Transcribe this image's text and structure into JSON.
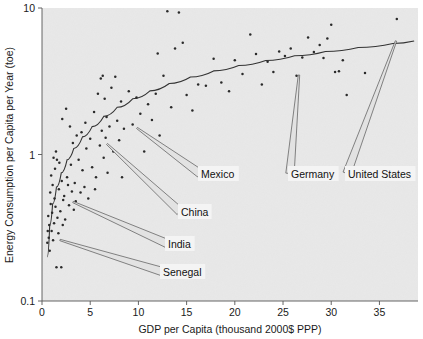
{
  "chart_data": {
    "type": "scatter",
    "title": "",
    "xlabel": "GDP per Capita (thousand 2000$ PPP)",
    "ylabel": "Energy Consumption per Capita per Year (toe)",
    "xlim": [
      0,
      39
    ],
    "ylim": [
      0.1,
      10
    ],
    "xscale": "linear",
    "yscale": "log",
    "grid": false,
    "legend": "none",
    "xticks": [
      0,
      5,
      10,
      15,
      20,
      25,
      30,
      35
    ],
    "xtick_labels": [
      "0",
      "5",
      "10",
      "15",
      "20",
      "25",
      "30",
      "35"
    ],
    "yticks": [
      0.1,
      1,
      10
    ],
    "ytick_labels": [
      "0.1",
      "1",
      "10"
    ],
    "series": [
      {
        "name": "countries",
        "marker": "dot",
        "points": [
          [
            0.6,
            0.3
          ],
          [
            0.7,
            0.27
          ],
          [
            0.75,
            0.33
          ],
          [
            0.8,
            0.22
          ],
          [
            0.85,
            0.55
          ],
          [
            0.9,
            0.46
          ],
          [
            0.95,
            0.72
          ],
          [
            1.0,
            0.3
          ],
          [
            1.05,
            0.4
          ],
          [
            1.1,
            0.62
          ],
          [
            1.15,
            0.26
          ],
          [
            1.2,
            0.95
          ],
          [
            1.25,
            0.34
          ],
          [
            1.3,
            0.5
          ],
          [
            1.35,
            0.8
          ],
          [
            1.4,
            0.44
          ],
          [
            1.45,
            1.05
          ],
          [
            1.5,
            0.17
          ],
          [
            1.6,
            0.37
          ],
          [
            1.7,
            0.29
          ],
          [
            1.75,
            0.58
          ],
          [
            1.8,
            0.88
          ],
          [
            1.9,
            0.41
          ],
          [
            2.0,
            0.17
          ],
          [
            2.05,
            0.66
          ],
          [
            2.1,
            1.75
          ],
          [
            2.2,
            0.49
          ],
          [
            2.3,
            0.52
          ],
          [
            2.4,
            0.36
          ],
          [
            2.5,
            2.05
          ],
          [
            2.6,
            0.7
          ],
          [
            2.7,
            0.62
          ],
          [
            2.8,
            0.45
          ],
          [
            2.9,
            1.55
          ],
          [
            3.0,
            0.85
          ],
          [
            3.1,
            0.56
          ],
          [
            3.2,
            1.2
          ],
          [
            3.4,
            0.64
          ],
          [
            3.5,
            0.48
          ],
          [
            3.6,
            1.35
          ],
          [
            3.8,
            0.92
          ],
          [
            4.0,
            0.55
          ],
          [
            4.1,
            1.42
          ],
          [
            4.2,
            0.78
          ],
          [
            4.4,
            0.6
          ],
          [
            4.6,
            1.1
          ],
          [
            4.8,
            0.5
          ],
          [
            5.0,
            1.28
          ],
          [
            5.2,
            0.82
          ],
          [
            5.4,
            1.95
          ],
          [
            5.6,
            0.7
          ],
          [
            5.8,
            2.6
          ],
          [
            6.0,
            1.15
          ],
          [
            6.1,
            3.3
          ],
          [
            6.2,
            1.45
          ],
          [
            6.3,
            3.45
          ],
          [
            6.4,
            0.95
          ],
          [
            6.5,
            2.4
          ],
          [
            6.6,
            1.3
          ],
          [
            6.8,
            0.75
          ],
          [
            7.0,
            1.55
          ],
          [
            7.2,
            2.85
          ],
          [
            7.4,
            1.05
          ],
          [
            7.6,
            3.4
          ],
          [
            7.8,
            1.7
          ],
          [
            8.0,
            1.25
          ],
          [
            8.2,
            2.3
          ],
          [
            8.5,
            1.5
          ],
          [
            8.8,
            0.88
          ],
          [
            9.0,
            2.7
          ],
          [
            9.4,
            1.6
          ],
          [
            9.8,
            2.45
          ],
          [
            10.2,
            1.9
          ],
          [
            10.6,
            1.05
          ],
          [
            11.0,
            2.2
          ],
          [
            11.4,
            1.72
          ],
          [
            11.8,
            2.6
          ],
          [
            12.2,
            1.35
          ],
          [
            12.6,
            3.45
          ],
          [
            13.0,
            9.5
          ],
          [
            13.4,
            2.1
          ],
          [
            13.8,
            5.3
          ],
          [
            14.2,
            9.3
          ],
          [
            14.6,
            5.8
          ],
          [
            15.0,
            2.55
          ],
          [
            15.6,
            2.0
          ],
          [
            16.2,
            3.0
          ],
          [
            17.0,
            2.95
          ],
          [
            17.8,
            4.5
          ],
          [
            18.6,
            3.1
          ],
          [
            19.4,
            2.7
          ],
          [
            20.0,
            4.4
          ],
          [
            20.8,
            3.55
          ],
          [
            21.6,
            6.6
          ],
          [
            22.2,
            4.85
          ],
          [
            22.8,
            3.0
          ],
          [
            23.4,
            4.3
          ],
          [
            24.0,
            3.65
          ],
          [
            24.6,
            5.05
          ],
          [
            25.2,
            4.7
          ],
          [
            25.8,
            5.3
          ],
          [
            26.4,
            3.45
          ],
          [
            27.0,
            4.6
          ],
          [
            27.6,
            6.3
          ],
          [
            28.2,
            5.0
          ],
          [
            28.8,
            5.6
          ],
          [
            29.2,
            4.55
          ],
          [
            29.6,
            6.2
          ],
          [
            30.0,
            7.7
          ],
          [
            30.4,
            3.65
          ],
          [
            30.8,
            3.7
          ],
          [
            31.2,
            4.4
          ],
          [
            31.6,
            2.55
          ],
          [
            33.5,
            3.6
          ],
          [
            36.8,
            8.4
          ],
          [
            0.55,
            0.25
          ],
          [
            0.65,
            0.38
          ],
          [
            1.55,
            0.92
          ],
          [
            2.15,
            0.33
          ],
          [
            3.3,
            0.42
          ],
          [
            4.5,
            1.65
          ],
          [
            5.5,
            0.58
          ],
          [
            6.7,
            1.8
          ],
          [
            8.3,
            0.7
          ],
          [
            12.0,
            4.9
          ]
        ]
      }
    ],
    "trend_curve": {
      "description": "smooth rising log-like fit through the cloud",
      "points": [
        [
          0.55,
          0.2
        ],
        [
          0.8,
          0.33
        ],
        [
          1.1,
          0.46
        ],
        [
          1.5,
          0.6
        ],
        [
          2.0,
          0.75
        ],
        [
          2.6,
          0.92
        ],
        [
          3.3,
          1.1
        ],
        [
          4.2,
          1.32
        ],
        [
          5.2,
          1.55
        ],
        [
          6.4,
          1.82
        ],
        [
          7.8,
          2.1
        ],
        [
          9.4,
          2.4
        ],
        [
          11.2,
          2.72
        ],
        [
          13.2,
          3.05
        ],
        [
          15.4,
          3.38
        ],
        [
          17.8,
          3.72
        ],
        [
          20.4,
          4.05
        ],
        [
          23.2,
          4.38
        ],
        [
          26.2,
          4.72
        ],
        [
          29.4,
          5.05
        ],
        [
          32.8,
          5.38
        ],
        [
          36.4,
          5.72
        ],
        [
          38.6,
          5.95
        ]
      ]
    },
    "annotations": [
      {
        "label": "Mexico",
        "point": [
          9.2,
          1.88
        ],
        "box_x": 198,
        "box_y": 166,
        "tip_x": 137,
        "tip_y": 128
      },
      {
        "label": "China",
        "point": [
          5.4,
          1.32
        ],
        "box_x": 178,
        "box_y": 204,
        "tip_x": 107,
        "tip_y": 144
      },
      {
        "label": "India",
        "point": [
          3.0,
          0.52
        ],
        "box_x": 165,
        "box_y": 236,
        "tip_x": 73,
        "tip_y": 202
      },
      {
        "label": "Senegal",
        "point": [
          1.6,
          0.25
        ],
        "box_x": 160,
        "box_y": 264,
        "tip_x": 60,
        "tip_y": 240
      },
      {
        "label": "Germany",
        "point": [
          26.6,
          4.3
        ],
        "box_x": 288,
        "box_y": 166,
        "tip_x": 299,
        "tip_y": 75
      },
      {
        "label": "United States",
        "point": [
          36.9,
          8.3
        ],
        "box_x": 345,
        "box_y": 166,
        "tip_x": 396,
        "tip_y": 41
      }
    ]
  },
  "style": {
    "plot_background": "#e8e8e8",
    "page_background": "#ffffff",
    "point_color": "#2a2a2a",
    "curve_color": "#333333",
    "axis_color": "#555555",
    "text_color": "#1a1a1a",
    "callout_fill": "#f4f4f4"
  }
}
